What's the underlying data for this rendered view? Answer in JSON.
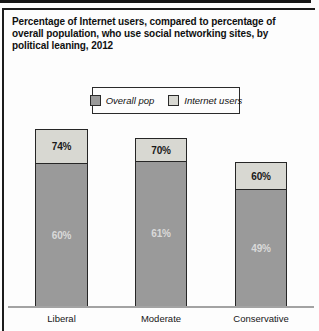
{
  "title_lines": [
    "Percentage of Internet users, compared to percentage of",
    "overall population, who use social networking sites, by",
    "political leaning, 2012"
  ],
  "chart_data": {
    "type": "bar",
    "subtype": "overlaid-percentage-bars",
    "title": "Percentage of Internet users, compared to percentage of overall population, who use social networking sites, by political leaning, 2012",
    "categories": [
      "Liberal",
      "Moderate",
      "Conservative"
    ],
    "series": [
      {
        "name": "Overall pop",
        "values": [
          60,
          61,
          49
        ],
        "labels": [
          "60%",
          "61%",
          "49%"
        ],
        "color": "#9a9a9a"
      },
      {
        "name": "Internet users",
        "values": [
          74,
          70,
          60
        ],
        "labels": [
          "74%",
          "70%",
          "60%"
        ],
        "color": "#d8d8d2"
      }
    ],
    "ylim": [
      0,
      100
    ],
    "grid": false,
    "legend_position": "top-center",
    "colors": {
      "overall_pop": "#9a9a9a",
      "internet_users": "#d8d8d2",
      "bar_border": "#262626",
      "axis": "#a3a3a3"
    }
  }
}
